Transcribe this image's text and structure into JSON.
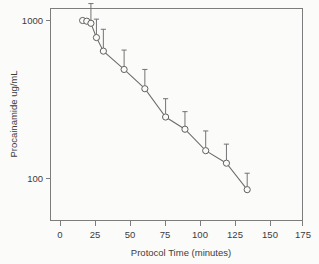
{
  "chart_data": {
    "type": "line",
    "title": "",
    "xlabel": "Protocol Time (minutes)",
    "ylabel": "Procainamide ug/mL",
    "yscale": "log",
    "xscale": "linear",
    "xlim": [
      -5,
      180
    ],
    "ylim": [
      50,
      1400
    ],
    "grid": false,
    "legend": null,
    "xticks": [
      0,
      25,
      50,
      75,
      100,
      125,
      150,
      175
    ],
    "xticklabels": [
      "0",
      "25",
      "50",
      "75",
      "100",
      "125",
      "150",
      "175"
    ],
    "yticks": [
      100,
      1000
    ],
    "yticklabels": [
      "100",
      "1000"
    ],
    "marker": "open-circle",
    "errorbar_direction": "up-only",
    "series": [
      {
        "name": "Procainamide concentration",
        "x": [
          16,
          19,
          22,
          26,
          31,
          46,
          61,
          76,
          90,
          105,
          120,
          135
        ],
        "values": [
          1000,
          990,
          960,
          780,
          640,
          490,
          370,
          245,
          205,
          150,
          125,
          85
        ],
        "error_upper": [
          1000,
          990,
          1280,
          1020,
          880,
          650,
          490,
          320,
          265,
          200,
          165,
          108
        ]
      }
    ]
  },
  "axes": {
    "x_tick_labels": [
      "0",
      "25",
      "50",
      "75",
      "100",
      "125",
      "150",
      "175"
    ],
    "y_tick_labels": [
      "1000",
      "100"
    ],
    "x_axis_title": "Protocol Time (minutes)",
    "y_axis_title": "Procainamide ug/mL"
  },
  "colors": {
    "line": "#6d6d6d",
    "marker_edge": "#5f5f5f",
    "marker_fill": "#fbfbfa",
    "frame": "#7d7d7d",
    "text": "#3c3c3c",
    "background": "#fbfbfa"
  }
}
